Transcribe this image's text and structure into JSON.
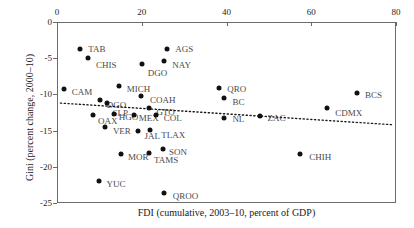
{
  "chart_data": {
    "type": "scatter",
    "title": "",
    "xlabel": "FDI (cumulative, 2003–10, percent of GDP)",
    "ylabel": "Gini (percent change, 2000–10)",
    "xlim": [
      0,
      80
    ],
    "ylim": [
      -25,
      0
    ],
    "xticks": [
      0,
      20,
      40,
      60,
      80
    ],
    "xticklabels": [
      "0",
      "20",
      "40",
      "60",
      "80"
    ],
    "yticks": [
      0,
      -5,
      -10,
      -15,
      -20,
      -25
    ],
    "yticklabels": [
      "0",
      "-5",
      "-10",
      "-15",
      "-20",
      "-25"
    ],
    "x_axis_position": "top",
    "grid": false,
    "legend": null,
    "marker": "filled-circle",
    "marker_color": "#111111",
    "label_color": "#4a4a4a",
    "frame_color": "#6b6b6b",
    "points": [
      {
        "label": "TAB",
        "x": 5.5,
        "y": -3.7,
        "lx": 8,
        "ly": 0
      },
      {
        "label": "CHIS",
        "x": 7.3,
        "y": -5.0,
        "lx": 8,
        "ly": 1.0
      },
      {
        "label": "AGS",
        "x": 26.0,
        "y": -3.7,
        "lx": 8,
        "ly": 0
      },
      {
        "label": "NAY",
        "x": 25.3,
        "y": -5.4,
        "lx": 8,
        "ly": 0.6
      },
      {
        "label": "DGO",
        "x": 20.0,
        "y": -5.8,
        "lx": 6,
        "ly": 1.3
      },
      {
        "label": "CAM",
        "x": 1.6,
        "y": -9.3,
        "lx": 8,
        "ly": 0.4
      },
      {
        "label": "MICH",
        "x": 14.6,
        "y": -8.8,
        "lx": 8,
        "ly": 0.4
      },
      {
        "label": "COAH",
        "x": 19.8,
        "y": -10.2,
        "lx": 9,
        "ly": 0.6
      },
      {
        "label": "QRO",
        "x": 38.3,
        "y": -9.1,
        "lx": 8,
        "ly": 0.2
      },
      {
        "label": "BC",
        "x": 39.3,
        "y": -10.5,
        "lx": 9,
        "ly": 0.6
      },
      {
        "label": "BCS",
        "x": 70.8,
        "y": -9.8,
        "lx": 8,
        "ly": 0.3
      },
      {
        "label": "CDMX",
        "x": 63.8,
        "y": -11.9,
        "lx": 8,
        "ly": 0.6
      },
      {
        "label": "DGO2",
        "x": 10.1,
        "y": -10.8,
        "lx": 7,
        "ly": 0.6
      },
      {
        "label": "ZAC",
        "x": 48.0,
        "y": -13.0,
        "lx": 7,
        "ly": 0.2
      },
      {
        "label": "NL",
        "x": 39.5,
        "y": -13.2,
        "lx": 8,
        "ly": 0.2
      },
      {
        "label": "GTO",
        "x": 21.8,
        "y": -11.9,
        "lx": 7,
        "ly": 0.5
      },
      {
        "label": "SLP",
        "x": 11.9,
        "y": -11.2,
        "lx": 5,
        "ly": 1.3
      },
      {
        "label": "HGO",
        "x": 13.4,
        "y": -12.7,
        "lx": 5,
        "ly": 0.4
      },
      {
        "label": "MEX",
        "x": 18.1,
        "y": -12.8,
        "lx": 5,
        "ly": 0.4
      },
      {
        "label": "COL",
        "x": 23.3,
        "y": -12.9,
        "lx": 8,
        "ly": 0.3
      },
      {
        "label": "OAX",
        "x": 8.5,
        "y": -12.8,
        "lx": 5,
        "ly": 0.9
      },
      {
        "label": "VER",
        "x": 11.3,
        "y": -14.5,
        "lx": 8,
        "ly": 0.6
      },
      {
        "label": "JAL",
        "x": 19.0,
        "y": -15.0,
        "lx": 7,
        "ly": 0.7
      },
      {
        "label": "TLAX",
        "x": 22.0,
        "y": -14.9,
        "lx": 11,
        "ly": 0.7
      },
      {
        "label": "MOR",
        "x": 15.1,
        "y": -18.2,
        "lx": 7,
        "ly": 0.5
      },
      {
        "label": "TAMS",
        "x": 21.7,
        "y": -18.1,
        "lx": 5,
        "ly": 0.9
      },
      {
        "label": "SON",
        "x": 25.0,
        "y": -17.5,
        "lx": 6,
        "ly": 0.4
      },
      {
        "label": "CHIH",
        "x": 57.4,
        "y": -18.3,
        "lx": 9,
        "ly": 0.3
      },
      {
        "label": "YUC",
        "x": 9.8,
        "y": -22.0,
        "lx": 8,
        "ly": 0.4
      },
      {
        "label": "QROO",
        "x": 25.2,
        "y": -23.6,
        "lx": 9,
        "ly": 0.5
      }
    ],
    "trendline": {
      "style": "dotted",
      "color": "#1a1a1a",
      "x_start": 0.8,
      "y_start": -11.2,
      "x_end": 79.5,
      "y_end": -14.2
    }
  }
}
